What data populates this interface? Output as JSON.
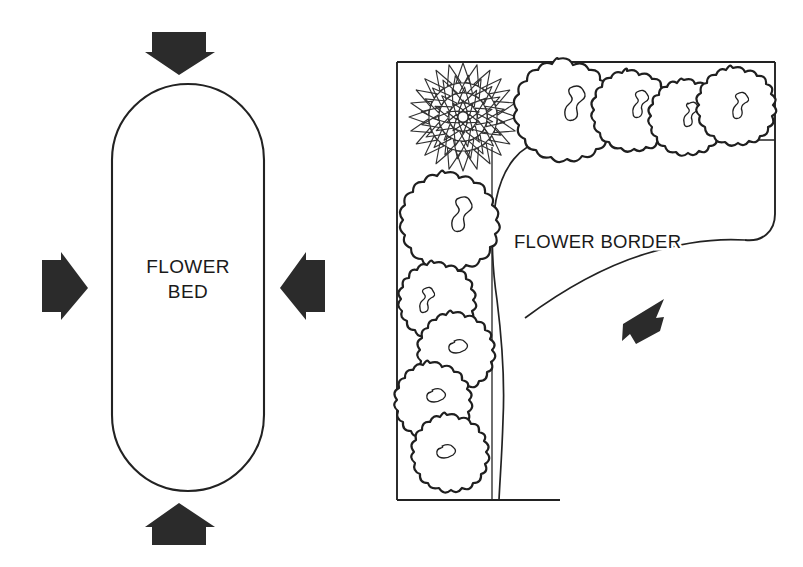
{
  "figure": {
    "background_color": "#ffffff",
    "ink_color": "#1a1a1a",
    "line_color": "#222222",
    "width": 803,
    "height": 567
  },
  "panels": [
    {
      "id": "flower-bed",
      "label_lines": [
        "FLOWER",
        "BED"
      ],
      "shape": "stadium-oval",
      "description": "Island flower bed viewed from all four sides",
      "arrows": [
        {
          "name": "arrow-top",
          "direction": "down"
        },
        {
          "name": "arrow-right",
          "direction": "left"
        },
        {
          "name": "arrow-bottom",
          "direction": "up"
        },
        {
          "name": "arrow-left",
          "direction": "right"
        }
      ]
    },
    {
      "id": "flower-border",
      "label": "FLOWER BORDER",
      "shape": "l-shaped-strip",
      "description": "Flower border against walls viewed from one side",
      "arrows": [
        {
          "name": "arrow-viewing-direction",
          "direction": "down-left"
        }
      ],
      "plants": [
        {
          "name": "dahlia-flower-symbol",
          "type": "radiating-petal-flower",
          "cx": 463,
          "cy": 117,
          "r": 56
        },
        {
          "name": "shrub-symbol-1",
          "type": "scalloped-shrub",
          "cx": 558,
          "cy": 101,
          "r": 42
        },
        {
          "name": "shrub-symbol-2",
          "type": "scalloped-shrub",
          "cx": 627,
          "cy": 103,
          "r": 33
        },
        {
          "name": "shrub-symbol-3",
          "type": "scalloped-shrub",
          "cx": 684,
          "cy": 110,
          "r": 31
        },
        {
          "name": "shrub-symbol-4",
          "type": "scalloped-shrub",
          "cx": 733,
          "cy": 100,
          "r": 32
        },
        {
          "name": "shrub-symbol-5",
          "type": "scalloped-shrub",
          "cx": 445,
          "cy": 214,
          "r": 41
        },
        {
          "name": "shrub-symbol-6",
          "type": "scalloped-shrub",
          "cx": 434,
          "cy": 295,
          "r": 32
        },
        {
          "name": "shrub-symbol-7",
          "type": "scalloped-shrub",
          "cx": 453,
          "cy": 345,
          "r": 32
        },
        {
          "name": "shrub-symbol-8",
          "type": "scalloped-shrub",
          "cx": 430,
          "cy": 395,
          "r": 32
        },
        {
          "name": "shrub-symbol-9",
          "type": "scalloped-shrub",
          "cx": 447,
          "cy": 447,
          "r": 32
        }
      ]
    }
  ]
}
